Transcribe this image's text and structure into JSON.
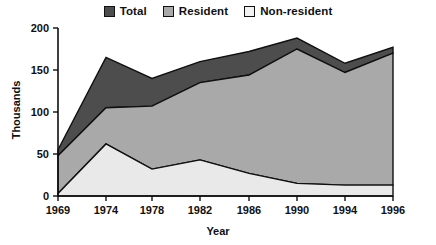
{
  "chart_data": {
    "type": "area",
    "title": "",
    "subtitle": "",
    "xlabel": "Year",
    "ylabel": "Thousands",
    "categories": [
      "1969",
      "1974",
      "1978",
      "1982",
      "1986",
      "1990",
      "1994",
      "1996"
    ],
    "x": [
      1969,
      1974,
      1978,
      1982,
      1986,
      1990,
      1994,
      1996
    ],
    "xlim": [
      1969,
      1996
    ],
    "ylim": [
      0,
      200
    ],
    "yticks": [
      0,
      50,
      100,
      150,
      200
    ],
    "xticks": [
      1969,
      1974,
      1978,
      1982,
      1986,
      1990,
      1994,
      1996
    ],
    "grid": false,
    "stacked": true,
    "legend_position": "top",
    "series": [
      {
        "name": "Non-resident",
        "values": [
          3,
          62,
          32,
          43,
          27,
          15,
          13,
          13
        ],
        "color": "#e3e3e3"
      },
      {
        "name": "Resident",
        "values": [
          45,
          43,
          75,
          92,
          117,
          160,
          134,
          157
        ],
        "color": "#a9a9a9"
      },
      {
        "name": "Total",
        "values": [
          55,
          165,
          140,
          160,
          172,
          188,
          158,
          177
        ],
        "color": "#4d4d4d",
        "note": "Total is the cumulative top boundary (Resident + Non-resident)"
      }
    ],
    "cumulative_boundaries": {
      "non_resident_top": [
        3,
        62,
        32,
        43,
        27,
        15,
        13,
        13
      ],
      "resident_top": [
        48,
        105,
        107,
        135,
        144,
        175,
        147,
        170
      ],
      "total_top": [
        55,
        165,
        140,
        160,
        172,
        188,
        158,
        177
      ]
    }
  },
  "legend": {
    "entries": [
      {
        "label": "Total",
        "color": "#4d4d4d"
      },
      {
        "label": "Resident",
        "color": "#a9a9a9"
      },
      {
        "label": "Non-resident",
        "color": "#f2f2f2"
      }
    ]
  },
  "axes": {
    "y": {
      "label": "Thousands",
      "ticks": [
        "0",
        "50",
        "100",
        "150",
        "200"
      ]
    },
    "x": {
      "label": "Year",
      "ticks": [
        "1969",
        "1974",
        "1978",
        "1982",
        "1986",
        "1990",
        "1994",
        "1996"
      ]
    }
  },
  "colors": {
    "total": "#4d4d4d",
    "resident": "#a9a9a9",
    "non_resident": "#e9e9e9",
    "axis": "#101010",
    "background": "#ffffff"
  }
}
